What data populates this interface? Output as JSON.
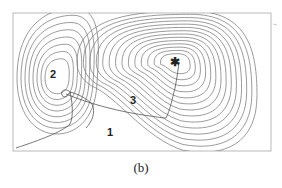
{
  "figure": {
    "caption": "(b)",
    "kind": "contour-plot",
    "regions": [
      {
        "id": "region-1",
        "label": "1"
      },
      {
        "id": "region-2",
        "label": "2"
      },
      {
        "id": "region-3",
        "label": "3"
      }
    ],
    "minimum_marker": {
      "glyph": "✱",
      "meaning": "global-minimum"
    },
    "basins": [
      {
        "name": "left-basin",
        "contour_count": 8
      },
      {
        "name": "right-basin",
        "contour_count": 14
      }
    ],
    "colors": {
      "contour": "#7a7a7a",
      "frame": "#b9b9b9",
      "text": "#222222"
    }
  }
}
